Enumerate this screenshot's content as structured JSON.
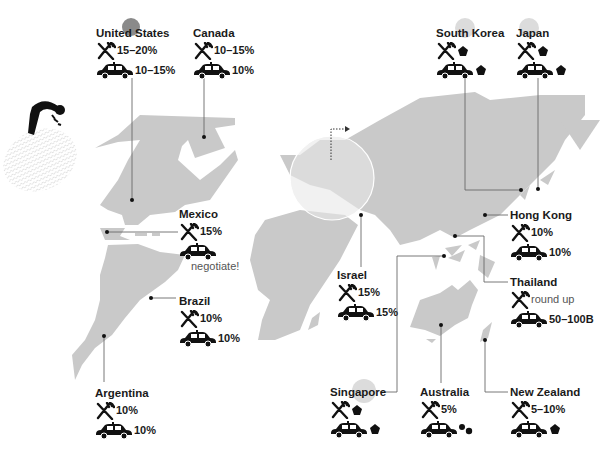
{
  "colors": {
    "land": "#c9c9c9",
    "ink": "#111111",
    "leader_line": "#777777",
    "highlight_us": "#8a8a8a",
    "highlight_asia": "#dcdcdc",
    "europe_lens": "#e8e8e8"
  },
  "icons": {
    "restaurant": "fork-knife-icon",
    "taxi": "taxi-icon",
    "no_tip": "pentagon-coin-icon",
    "small_change": "coins-icon",
    "person": "bowing-person-icon",
    "fingerprint": "fingerprint-icon",
    "zoom_arrow": "dotted-arrow-icon"
  },
  "countries": [
    {
      "id": "us",
      "name": "United States",
      "restaurant": "15–20%",
      "taxi": "10–15%"
    },
    {
      "id": "canada",
      "name": "Canada",
      "restaurant": "10–15%",
      "taxi": "10%"
    },
    {
      "id": "mexico",
      "name": "Mexico",
      "restaurant": "15%",
      "taxi": "",
      "taxi_note": "negotiate!"
    },
    {
      "id": "brazil",
      "name": "Brazil",
      "restaurant": "10%",
      "taxi": "10%"
    },
    {
      "id": "argentina",
      "name": "Argentina",
      "restaurant": "10%",
      "taxi": "10%"
    },
    {
      "id": "israel",
      "name": "Israel",
      "restaurant": "15%",
      "taxi": "15%"
    },
    {
      "id": "south_korea",
      "name": "South Korea",
      "restaurant": "no tip",
      "taxi": "no tip"
    },
    {
      "id": "japan",
      "name": "Japan",
      "restaurant": "no tip",
      "taxi": "no tip"
    },
    {
      "id": "hong_kong",
      "name": "Hong Kong",
      "restaurant": "10%",
      "taxi": "10%"
    },
    {
      "id": "thailand",
      "name": "Thailand",
      "restaurant": "round up",
      "taxi": "50–100B"
    },
    {
      "id": "singapore",
      "name": "Singapore",
      "restaurant": "no tip",
      "taxi": "no tip"
    },
    {
      "id": "australia",
      "name": "Australia",
      "restaurant": "5%",
      "taxi": "small change"
    },
    {
      "id": "new_zealand",
      "name": "New Zealand",
      "restaurant": "5–10%",
      "taxi": "no tip"
    }
  ]
}
